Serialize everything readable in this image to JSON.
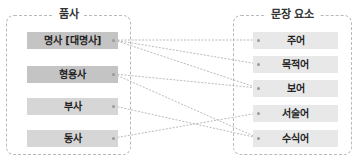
{
  "left_group": {
    "title": "품사",
    "items": [
      {
        "id": "noun",
        "label": "명사 [대명사]"
      },
      {
        "id": "adjective",
        "label": "형용사"
      },
      {
        "id": "adverb",
        "label": "부사"
      },
      {
        "id": "verb",
        "label": "동사"
      }
    ]
  },
  "right_group": {
    "title": "문장 요소",
    "items": [
      {
        "id": "subject",
        "label": "주어"
      },
      {
        "id": "object",
        "label": "목적어"
      },
      {
        "id": "complement",
        "label": "보어"
      },
      {
        "id": "predicate",
        "label": "서술어"
      },
      {
        "id": "modifier",
        "label": "수식어"
      }
    ]
  },
  "connections": [
    {
      "from": "명사 [대명사]",
      "to": "주어"
    },
    {
      "from": "명사 [대명사]",
      "to": "목적어"
    },
    {
      "from": "명사 [대명사]",
      "to": "보어"
    },
    {
      "from": "형용사",
      "to": "보어"
    },
    {
      "from": "형용사",
      "to": "수식어"
    },
    {
      "from": "부사",
      "to": "수식어"
    },
    {
      "from": "동사",
      "to": "서술어"
    }
  ],
  "colors": {
    "left_box_dark": "#c4c4c4",
    "left_box_light": "#d6d6d6",
    "right_box": "#e8e8e8",
    "line": "#a8a8a8"
  }
}
